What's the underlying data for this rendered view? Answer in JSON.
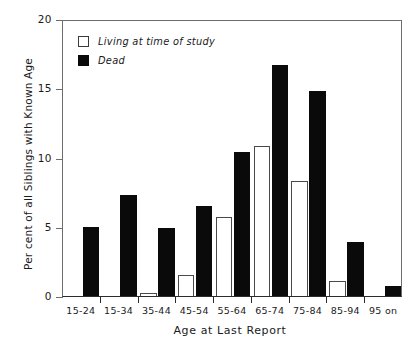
{
  "chart_data": {
    "type": "bar",
    "title": "",
    "xlabel": "Age at Last Report",
    "ylabel": "Per cent of all Siblings with Known Age",
    "categories": [
      "15-24",
      "15-34",
      "35-44",
      "45-54",
      "55-64",
      "65-74",
      "75-84",
      "85-94",
      "95 on"
    ],
    "series": [
      {
        "name": "Living at time of study",
        "color": "#ffffff",
        "edge_color": "#4a4a4a",
        "values": [
          0,
          0,
          0.2,
          1.5,
          5.7,
          10.8,
          8.3,
          1.1,
          0
        ]
      },
      {
        "name": "Dead",
        "color": "#0a0a0a",
        "edge_color": "#0a0a0a",
        "values": [
          5.0,
          7.3,
          4.9,
          6.5,
          10.4,
          16.7,
          14.8,
          3.9,
          0.75
        ]
      }
    ],
    "ylim": [
      0,
      20
    ],
    "yticks": [
      0,
      5,
      10,
      15,
      20
    ],
    "ytick_labels": [
      "0",
      "5",
      "10",
      "15",
      "20"
    ],
    "grid": false,
    "legend_position": "upper left"
  },
  "legend": {
    "entries": [
      {
        "label": "Living at time of study",
        "swatch": "open-square-swatch"
      },
      {
        "label": "Dead",
        "swatch": "filled-square-swatch"
      }
    ]
  },
  "axes": {
    "y_title": "Per cent of all Siblings with Known Age",
    "x_title": "Age at Last Report"
  }
}
